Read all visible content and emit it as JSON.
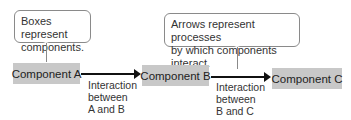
{
  "callouts": {
    "boxes": {
      "line1": "Boxes represent",
      "line2": "components."
    },
    "arrows": {
      "line1": "Arrows represent processes",
      "line2": "by which components interact."
    }
  },
  "components": [
    {
      "label": "Component A"
    },
    {
      "label": "Component B"
    },
    {
      "label": "Component C"
    }
  ],
  "interactions": [
    {
      "line1": "Interaction",
      "line2": "between",
      "line3": "A and B"
    },
    {
      "line1": "Interaction",
      "line2": "between",
      "line3": "B and C"
    }
  ],
  "colors": {
    "box_fill": "#c8c8c8",
    "arrow": "#111111",
    "callout_border": "#8a8a8a"
  }
}
